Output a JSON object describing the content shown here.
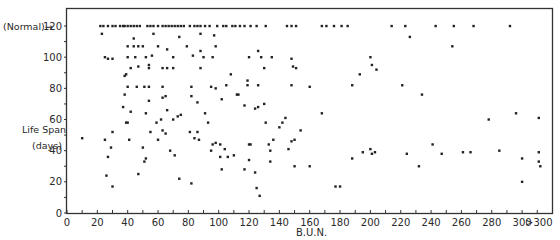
{
  "chart_data": {
    "type": "scatter",
    "title": "",
    "xlabel": "B.U.N.",
    "ylabel": "Life Span (days)",
    "ylabel_lines": [
      "Life Span",
      "(days)"
    ],
    "normal_annotation": "(Normal)→",
    "x_ticks": [
      0,
      20,
      40,
      60,
      80,
      100,
      120,
      140,
      160,
      180,
      200,
      220,
      240,
      260,
      280,
      300
    ],
    "x_tick_labels": [
      "0",
      "20",
      "40",
      "60",
      "80",
      "100",
      "120",
      "140",
      "160",
      "180",
      "200",
      "220",
      "240",
      "260",
      "280",
      "300",
      ">300"
    ],
    "y_ticks": [
      0,
      20,
      40,
      60,
      80,
      100,
      120
    ],
    "y_tick_labels": [
      "0",
      "20",
      "40",
      "60",
      "80",
      "100",
      "120"
    ],
    "xlim": [
      0,
      315
    ],
    "ylim": [
      0,
      122
    ],
    "grid": false,
    "legend": null,
    "points": [
      [
        22,
        120
      ],
      [
        24,
        120
      ],
      [
        27,
        120
      ],
      [
        30,
        120
      ],
      [
        32,
        120
      ],
      [
        35,
        120
      ],
      [
        37,
        120
      ],
      [
        38,
        120
      ],
      [
        40,
        120
      ],
      [
        42,
        120
      ],
      [
        44,
        120
      ],
      [
        46,
        120
      ],
      [
        48,
        120
      ],
      [
        53,
        120
      ],
      [
        55,
        120
      ],
      [
        57,
        120
      ],
      [
        60,
        120
      ],
      [
        63,
        120
      ],
      [
        65,
        120
      ],
      [
        67,
        120
      ],
      [
        69,
        120
      ],
      [
        71,
        120
      ],
      [
        73,
        120
      ],
      [
        75,
        120
      ],
      [
        77,
        120
      ],
      [
        81,
        120
      ],
      [
        84,
        120
      ],
      [
        86,
        120
      ],
      [
        88,
        120
      ],
      [
        91,
        120
      ],
      [
        94,
        120
      ],
      [
        99,
        120
      ],
      [
        103,
        120
      ],
      [
        105,
        120
      ],
      [
        109,
        120
      ],
      [
        111,
        120
      ],
      [
        114,
        120
      ],
      [
        117,
        120
      ],
      [
        121,
        120
      ],
      [
        125,
        120
      ],
      [
        131,
        120
      ],
      [
        145,
        120
      ],
      [
        148,
        120
      ],
      [
        151,
        120
      ],
      [
        168,
        120
      ],
      [
        171,
        120
      ],
      [
        176,
        120
      ],
      [
        181,
        120
      ],
      [
        185,
        120
      ],
      [
        214,
        120
      ],
      [
        223,
        120
      ],
      [
        243,
        120
      ],
      [
        255,
        120
      ],
      [
        268,
        120
      ],
      [
        292,
        120
      ],
      [
        23,
        115
      ],
      [
        44,
        112
      ],
      [
        57,
        115
      ],
      [
        74,
        113
      ],
      [
        88,
        115
      ],
      [
        97,
        114
      ],
      [
        226,
        113
      ],
      [
        254,
        107
      ],
      [
        25,
        100
      ],
      [
        27,
        99
      ],
      [
        30,
        99
      ],
      [
        40,
        100
      ],
      [
        45,
        100
      ],
      [
        52,
        100
      ],
      [
        56,
        101
      ],
      [
        70,
        100
      ],
      [
        83,
        101
      ],
      [
        90,
        100
      ],
      [
        96,
        100
      ],
      [
        120,
        100
      ],
      [
        128,
        100
      ],
      [
        135,
        100
      ],
      [
        148,
        99
      ],
      [
        200,
        100
      ],
      [
        201,
        95
      ],
      [
        204,
        92
      ],
      [
        40,
        107
      ],
      [
        44,
        107
      ],
      [
        47,
        107
      ],
      [
        50,
        107
      ],
      [
        60,
        107
      ],
      [
        66,
        105
      ],
      [
        79,
        107
      ],
      [
        88,
        104
      ],
      [
        98,
        107
      ],
      [
        126,
        104
      ],
      [
        42,
        93
      ],
      [
        47,
        94
      ],
      [
        54,
        93
      ],
      [
        54,
        95
      ],
      [
        63,
        93
      ],
      [
        66,
        93
      ],
      [
        70,
        93
      ],
      [
        88,
        93
      ],
      [
        108,
        89
      ],
      [
        130,
        93
      ],
      [
        149,
        94
      ],
      [
        151,
        93
      ],
      [
        193,
        89
      ],
      [
        38,
        88
      ],
      [
        39,
        89
      ],
      [
        40,
        81
      ],
      [
        46,
        81
      ],
      [
        51,
        81
      ],
      [
        54,
        81
      ],
      [
        63,
        81
      ],
      [
        63,
        74
      ],
      [
        65,
        75
      ],
      [
        82,
        81
      ],
      [
        95,
        81
      ],
      [
        98,
        80
      ],
      [
        105,
        82
      ],
      [
        113,
        76
      ],
      [
        119,
        82
      ],
      [
        119,
        85
      ],
      [
        126,
        82
      ],
      [
        148,
        82
      ],
      [
        160,
        81
      ],
      [
        188,
        82
      ],
      [
        221,
        82
      ],
      [
        38,
        76
      ],
      [
        37,
        68
      ],
      [
        54,
        72
      ],
      [
        66,
        66
      ],
      [
        82,
        75
      ],
      [
        86,
        71
      ],
      [
        102,
        73
      ],
      [
        112,
        76
      ],
      [
        117,
        69
      ],
      [
        124,
        67
      ],
      [
        126,
        68
      ],
      [
        130,
        70
      ],
      [
        168,
        64
      ],
      [
        234,
        76
      ],
      [
        10,
        48
      ],
      [
        25,
        47
      ],
      [
        26,
        24
      ],
      [
        27,
        36
      ],
      [
        29,
        42
      ],
      [
        30,
        52
      ],
      [
        30,
        17
      ],
      [
        39,
        58
      ],
      [
        40,
        58
      ],
      [
        41,
        47
      ],
      [
        42,
        65
      ],
      [
        47,
        25
      ],
      [
        50,
        42
      ],
      [
        51,
        33
      ],
      [
        52,
        35
      ],
      [
        52,
        64
      ],
      [
        55,
        52
      ],
      [
        59,
        58
      ],
      [
        60,
        47
      ],
      [
        62,
        60
      ],
      [
        63,
        53
      ],
      [
        65,
        51
      ],
      [
        68,
        40
      ],
      [
        70,
        60
      ],
      [
        71,
        37
      ],
      [
        73,
        62
      ],
      [
        74,
        22
      ],
      [
        75,
        63
      ],
      [
        81,
        52
      ],
      [
        82,
        19
      ],
      [
        84,
        48
      ],
      [
        86,
        52
      ],
      [
        87,
        47
      ],
      [
        91,
        64
      ],
      [
        93,
        58
      ],
      [
        95,
        40
      ],
      [
        96,
        44
      ],
      [
        98,
        45
      ],
      [
        101,
        44
      ],
      [
        101,
        36
      ],
      [
        102,
        28
      ],
      [
        104,
        41
      ],
      [
        106,
        36
      ],
      [
        110,
        37
      ],
      [
        117,
        28
      ],
      [
        120,
        34
      ],
      [
        120,
        44
      ],
      [
        121,
        44
      ],
      [
        124,
        26
      ],
      [
        125,
        16
      ],
      [
        127,
        11
      ],
      [
        131,
        58
      ],
      [
        133,
        44
      ],
      [
        134,
        40
      ],
      [
        134,
        33
      ],
      [
        136,
        47
      ],
      [
        140,
        55
      ],
      [
        142,
        58
      ],
      [
        144,
        61
      ],
      [
        146,
        41
      ],
      [
        148,
        46
      ],
      [
        150,
        30
      ],
      [
        150,
        47
      ],
      [
        154,
        53
      ],
      [
        160,
        30
      ],
      [
        177,
        17
      ],
      [
        180,
        17
      ],
      [
        188,
        35
      ],
      [
        195,
        39
      ],
      [
        200,
        41
      ],
      [
        201,
        38
      ],
      [
        203,
        39
      ],
      [
        224,
        38
      ],
      [
        232,
        30
      ],
      [
        241,
        44
      ],
      [
        247,
        38
      ],
      [
        261,
        39
      ],
      [
        266,
        39
      ],
      [
        278,
        60
      ],
      [
        285,
        40
      ],
      [
        296,
        64
      ],
      [
        300,
        35
      ],
      [
        300,
        20
      ],
      [
        311,
        61
      ],
      [
        311,
        39
      ],
      [
        311,
        33
      ],
      [
        312,
        30
      ]
    ]
  }
}
